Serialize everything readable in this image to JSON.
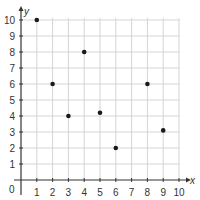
{
  "chart_data": {
    "type": "scatter",
    "title": "",
    "xlabel": "x",
    "ylabel": "y",
    "xlim": [
      0,
      10
    ],
    "ylim": [
      0,
      10
    ],
    "grid": true,
    "x_ticks": [
      1,
      2,
      3,
      4,
      5,
      6,
      7,
      8,
      9,
      10
    ],
    "y_ticks": [
      1,
      2,
      3,
      4,
      5,
      6,
      7,
      8,
      9,
      10
    ],
    "origin_label": "0",
    "points": [
      {
        "x": 1,
        "y": 10
      },
      {
        "x": 2,
        "y": 6
      },
      {
        "x": 3,
        "y": 4
      },
      {
        "x": 4,
        "y": 8
      },
      {
        "x": 5,
        "y": 4.2
      },
      {
        "x": 6,
        "y": 2
      },
      {
        "x": 8,
        "y": 6
      },
      {
        "x": 9,
        "y": 3.1
      }
    ]
  },
  "colors": {
    "grid": "#d4d4d4",
    "axis": "#333333",
    "point": "#1a1a1a"
  }
}
